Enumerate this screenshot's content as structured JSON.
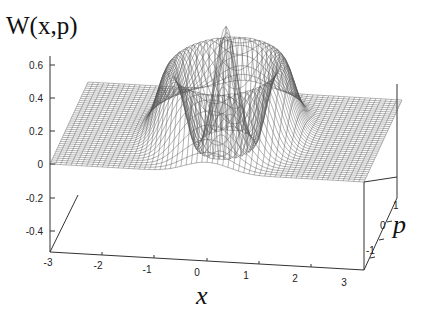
{
  "chart_data": {
    "type": "surface",
    "title": "",
    "function_label": "W(x,p)",
    "zlabel": "W(x,p)",
    "xlabel": "x",
    "ylabel": "p",
    "x_ticks": [
      "-3",
      "-2",
      "-1",
      "0",
      "1",
      "2",
      "3"
    ],
    "p_ticks": [
      "-1",
      "0",
      "1"
    ],
    "z_ticks": [
      "0.6",
      "0.4",
      "0.2",
      "0",
      "-0.2",
      "-0.4"
    ],
    "xlim": [
      -3,
      3
    ],
    "plim": [
      -1.5,
      1.5
    ],
    "zlim": [
      -0.5,
      0.65
    ],
    "grid": false,
    "legend": "none",
    "features": [
      {
        "name": "central peak",
        "x": 0,
        "p": 0,
        "z": 0.64
      },
      {
        "name": "outer ring ridge",
        "radius": 1.0,
        "z": 0.4
      },
      {
        "name": "negative dip ring",
        "radius": 0.5,
        "z": -0.1
      }
    ]
  }
}
